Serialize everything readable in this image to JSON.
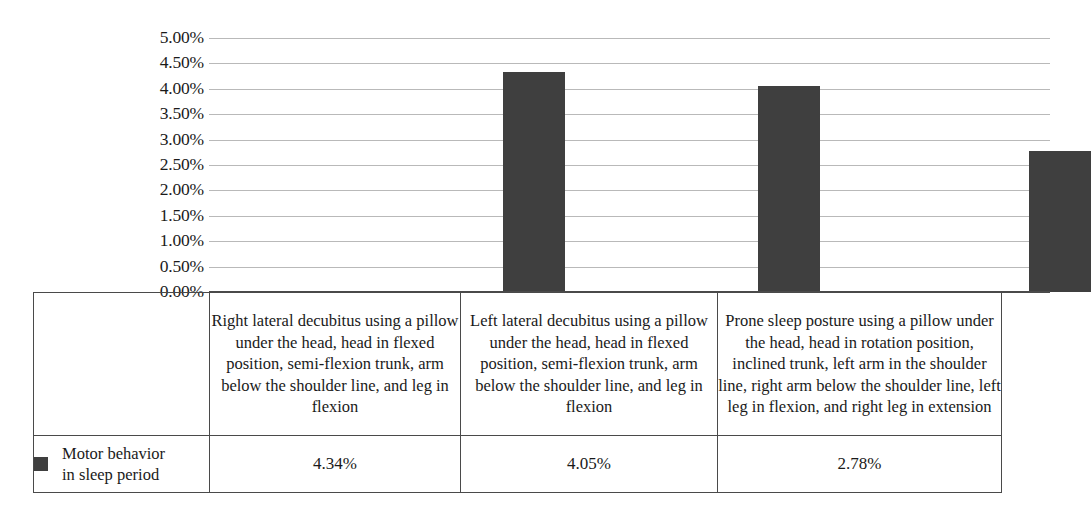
{
  "chart_data": {
    "type": "bar",
    "title": "",
    "xlabel": "",
    "ylabel": "",
    "ylim": [
      0,
      5
    ],
    "grid": true,
    "legend_position": "bottom-left-table",
    "y_ticks": [
      "0.00%",
      "0.50%",
      "1.00%",
      "1.50%",
      "2.00%",
      "2.50%",
      "3.00%",
      "3.50%",
      "4.00%",
      "4.50%",
      "5.00%"
    ],
    "y_tick_values": [
      0,
      0.5,
      1,
      1.5,
      2,
      2.5,
      3,
      3.5,
      4,
      4.5,
      5
    ],
    "categories": [
      "Right lateral decubitus using a pillow under the head, head in flexed position, semi-flexion trunk, arm below the shoulder line, and leg in flexion",
      "Left lateral decubitus using a pillow under the head, head in flexed position, semi-flexion trunk, arm below the shoulder line, and leg in flexion",
      "Prone sleep posture using a pillow under the head, head in rotation position, inclined trunk, left arm in the shoulder line, right arm below the shoulder line, left leg in flexion, and right leg in extension"
    ],
    "series": [
      {
        "name": "Motor behavior in sleep period",
        "name_line1": "Motor behavior",
        "name_line2": "in sleep period",
        "color": "#3f3f3f",
        "values": [
          4.34,
          4.05,
          2.78
        ],
        "value_labels": [
          "4.34%",
          "4.05%",
          "2.78%"
        ]
      }
    ]
  },
  "legend": {
    "swatch_color": "#3f3f3f",
    "label_line1": "Motor behavior",
    "label_line2": "in sleep period"
  },
  "colors": {
    "bar": "#3f3f3f",
    "gridline": "#b9b9b9",
    "axis": "#4a4a4a",
    "border": "#4a4a4a",
    "background": "#ffffff",
    "text": "#1a1a1a"
  }
}
